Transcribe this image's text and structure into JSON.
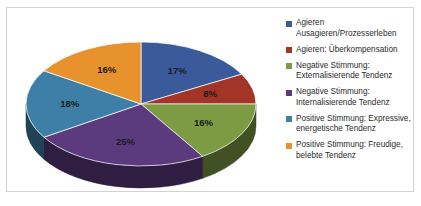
{
  "chart_data": {
    "type": "pie",
    "title": "",
    "three_d": true,
    "legend_position": "right",
    "categories": [
      "Agieren Ausagieren/Prozesserleben",
      "Agieren: Überkompensation",
      "Negative Stimmung: Externalisierende Tendenz",
      "Negative Stimmung: Internalisierende Tendenz",
      "Positive Stimmung: Expressive, energetische Tendenz",
      "Positive Stimmung: Freudige, belebte Tendenz"
    ],
    "values": [
      17,
      8,
      16,
      25,
      18,
      16
    ],
    "value_labels": [
      "17%",
      "8%",
      "16%",
      "25%",
      "18%",
      "16%"
    ],
    "colors": [
      "#3a5a9b",
      "#a33528",
      "#7d9b43",
      "#5b3a7e",
      "#3e7fa8",
      "#e8922e"
    ]
  },
  "legend": {
    "items": [
      {
        "label": "Agieren\nAusagieren/Prozesserleben",
        "color": "#3a5a9b"
      },
      {
        "label": "Agieren: Überkompensation",
        "color": "#a33528"
      },
      {
        "label": "Negative Stimmung:\nExternalisierende Tendenz",
        "color": "#7d9b43"
      },
      {
        "label": "Negative Stimmung:\nInternalisierende Tendenz",
        "color": "#5b3a7e"
      },
      {
        "label": "Positive Stimmung: Expressive,\nenergetische Tendenz",
        "color": "#3e7fa8"
      },
      {
        "label": "Positive Stimmung: Freudige,\nbelebte Tendenz",
        "color": "#e8922e"
      }
    ]
  },
  "slices": {
    "s0": "17%",
    "s1": "8%",
    "s2": "16%",
    "s3": "25%",
    "s4": "18%",
    "s5": "16%"
  }
}
